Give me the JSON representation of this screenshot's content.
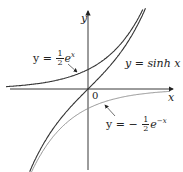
{
  "diagram": {
    "axes": {
      "x_label": "x",
      "y_label": "y",
      "origin_label": "0"
    },
    "curves": [
      {
        "name": "half-exp",
        "label_lhs": "y =",
        "label_frac": {
          "num": "1",
          "den": "2"
        },
        "label_rhs": "e",
        "label_exp": "x"
      },
      {
        "name": "sinh",
        "label": "y = sinh x"
      },
      {
        "name": "neg-half-exp-neg",
        "label_lhs": "y = −",
        "label_frac": {
          "num": "1",
          "den": "2"
        },
        "label_rhs": "e",
        "label_exp": "−x"
      }
    ],
    "colors": {
      "axes": "#222222",
      "curve_dark": "#333333",
      "curve_light": "#777777"
    }
  }
}
